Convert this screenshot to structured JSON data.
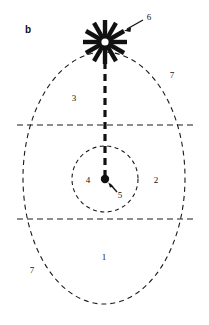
{
  "figure": {
    "panel_letter": "b",
    "background_color": "#ffffff",
    "stroke_color": "#1a1a1a",
    "canvas": {
      "width": 209,
      "height": 325
    }
  },
  "shapes": {
    "outer_ellipse": {
      "name": "outer-dashed-ellipse",
      "cx": 104,
      "cy": 178,
      "rx": 81,
      "ry": 126,
      "style": "dashed",
      "dash": "5 4",
      "stroke_width": 1.1
    },
    "inner_circle": {
      "name": "inner-dashed-circle",
      "cx": 105,
      "cy": 179,
      "r": 33,
      "style": "dashed",
      "dash": "4 3.5",
      "stroke_width": 1.1
    },
    "upper_horizontal_line": {
      "name": "upper-horizontal-dashed-line",
      "x1": 17,
      "y1": 125,
      "x2": 196,
      "y2": 125,
      "style": "dashed",
      "dash": "6 4",
      "stroke_width": 1.1
    },
    "lower_horizontal_line": {
      "name": "lower-horizontal-dashed-line",
      "x1": 17,
      "y1": 219,
      "x2": 196,
      "y2": 219,
      "style": "dashed",
      "dash": "6 4",
      "stroke_width": 1.1
    },
    "vertical_thick_dashed_line": {
      "name": "central-thick-dashed-axis",
      "x1": 105,
      "y1": 62,
      "x2": 105,
      "y2": 178,
      "style": "dashed",
      "dash": "7 5",
      "stroke_width": 3.2
    },
    "center_dot": {
      "name": "center-filled-dot",
      "cx": 105,
      "cy": 179,
      "r": 4.2,
      "fill": "#111111"
    },
    "starburst": {
      "name": "starburst-marker",
      "cx": 105,
      "cy": 42,
      "spokes": 12,
      "spoke_length": 22,
      "spoke_width": 4.4,
      "hub_radius": 3.6,
      "hub_fill": "#ffffff",
      "spoke_fill": "#111111"
    },
    "arrow_to_starburst": {
      "name": "arrow-to-starburst",
      "from_x": 142,
      "from_y": 20,
      "to_x": 123,
      "to_y": 30
    },
    "arrow_to_center_dot": {
      "name": "arrow-to-center-dot",
      "from_x": 116,
      "from_y": 191,
      "to_x": 108,
      "to_y": 183
    }
  },
  "labels": [
    {
      "id": "panel-letter-b",
      "text": "b",
      "x": 28,
      "y": 30,
      "bold": true,
      "size": 10
    },
    {
      "id": "callout-6",
      "text": "6",
      "x": 149,
      "y": 17,
      "bold": false,
      "size": 9
    },
    {
      "id": "callout-7-top",
      "text": "7",
      "x": 172,
      "y": 75,
      "bold": false,
      "size": 9
    },
    {
      "id": "callout-3",
      "text": "3",
      "x": 74,
      "y": 98,
      "bold": false,
      "size": 9
    },
    {
      "id": "callout-4",
      "text": "4",
      "x": 88,
      "y": 180,
      "bold": false,
      "size": 9
    },
    {
      "id": "callout-2",
      "text": "2",
      "x": 156,
      "y": 180,
      "bold": false,
      "size": 9
    },
    {
      "id": "callout-5",
      "text": "5",
      "x": 120,
      "y": 195,
      "bold": false,
      "size": 9
    },
    {
      "id": "callout-1",
      "text": "1",
      "x": 104,
      "y": 257,
      "bold": false,
      "size": 9
    },
    {
      "id": "callout-7-bottom",
      "text": "7",
      "x": 32,
      "y": 270,
      "bold": false,
      "size": 9
    }
  ]
}
